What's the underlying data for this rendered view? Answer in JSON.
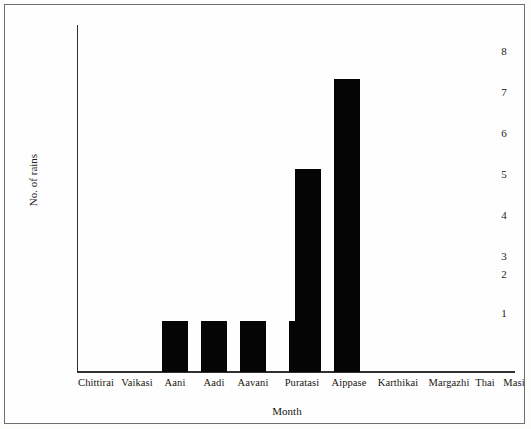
{
  "chart_data": {
    "type": "bar",
    "title": "",
    "xlabel": "Month",
    "ylabel": "No. of rains",
    "categories": [
      "Chittirai",
      "Vaikasi",
      "Aani",
      "Aadi",
      "Aavani",
      "Puratasi",
      "Aippase",
      "Karthikai",
      "Margazhi",
      "Thai",
      "Masi",
      "Panguni"
    ],
    "values": [
      0,
      0,
      1,
      1,
      1,
      1,
      4.7,
      6.9,
      0,
      0,
      0,
      0
    ],
    "ylim": [
      0,
      8
    ],
    "yticks": [
      1,
      2,
      3,
      4,
      5,
      6,
      7,
      8
    ],
    "grid": false,
    "legend": false,
    "bar_color": "#050505"
  },
  "axes": {
    "y_tick_labels": [
      "8",
      "7",
      "6",
      "5",
      "4",
      "3",
      "2",
      "1"
    ],
    "y_axis_title": "No. of rains",
    "x_axis_title": "Month",
    "x_tick_labels": [
      "Chittirai",
      "Vaikasi",
      "Aani",
      "Aadi",
      "Aavani",
      "Puratasi",
      "Aippase",
      "Karthikai",
      "Margazhi",
      "Thai",
      "Masi",
      "Panguni"
    ]
  },
  "colors": {
    "bar": "#050505",
    "axis": "#33312f",
    "frame": "#6e6e6e",
    "background": "#fefefe",
    "text": "#18150f"
  }
}
